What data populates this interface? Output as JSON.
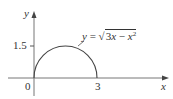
{
  "diagram": {
    "axes": {
      "x_label": "x",
      "y_label": "y",
      "origin_label": "0",
      "x_tick": "3",
      "y_tick": "1.5"
    },
    "curve": {
      "eq_lhs": "y",
      "eq_equals": "=",
      "eq_radicand_a": "3",
      "eq_radicand_var1": "x",
      "eq_minus": " − ",
      "eq_radicand_var2": "x",
      "eq_exponent": "2",
      "description": "upper semicircle from (0,0) to (3,0), peak at (1.5,1.5)"
    },
    "colors": {
      "axis": "#555555",
      "curve": "#444444",
      "text": "#333333"
    }
  }
}
